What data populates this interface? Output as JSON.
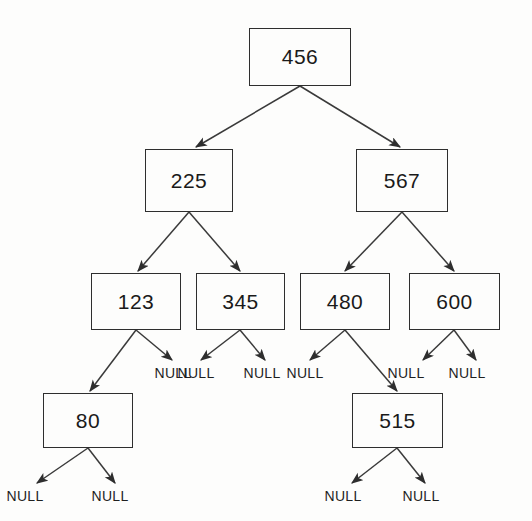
{
  "diagram": {
    "null_label": "NULL",
    "colors": {
      "background": "#fdfdfc",
      "box_border": "#2e2e2e",
      "text": "#1a1a1a",
      "edge": "#3a3a3a"
    },
    "nodes": [
      {
        "id": "n456",
        "value": "456",
        "level": 0,
        "x": 249,
        "y": 28,
        "w": 102,
        "h": 58
      },
      {
        "id": "n225",
        "value": "225",
        "level": 1,
        "x": 145,
        "y": 149,
        "w": 88,
        "h": 63
      },
      {
        "id": "n567",
        "value": "567",
        "level": 1,
        "x": 356,
        "y": 149,
        "w": 92,
        "h": 63
      },
      {
        "id": "n123",
        "value": "123",
        "level": 2,
        "x": 91,
        "y": 273,
        "w": 90,
        "h": 57
      },
      {
        "id": "n345",
        "value": "345",
        "level": 2,
        "x": 196,
        "y": 273,
        "w": 89,
        "h": 57
      },
      {
        "id": "n480",
        "value": "480",
        "level": 2,
        "x": 300,
        "y": 273,
        "w": 90,
        "h": 57
      },
      {
        "id": "n600",
        "value": "600",
        "level": 2,
        "x": 409,
        "y": 273,
        "w": 91,
        "h": 57
      },
      {
        "id": "n80",
        "value": "80",
        "level": 3,
        "x": 43,
        "y": 393,
        "w": 90,
        "h": 55
      },
      {
        "id": "n515",
        "value": "515",
        "level": 3,
        "x": 352,
        "y": 393,
        "w": 91,
        "h": 55
      }
    ],
    "null_children": [
      {
        "id": "null_123_right",
        "parent": "n123",
        "side": "right",
        "x": 173,
        "y": 365
      },
      {
        "id": "null_345_left",
        "parent": "n345",
        "side": "left",
        "x": 196,
        "y": 365
      },
      {
        "id": "null_345_right",
        "parent": "n345",
        "side": "right",
        "x": 262,
        "y": 365
      },
      {
        "id": "null_480_left",
        "parent": "n480",
        "side": "left",
        "x": 305,
        "y": 365
      },
      {
        "id": "null_600_left",
        "parent": "n600",
        "side": "left",
        "x": 406,
        "y": 365
      },
      {
        "id": "null_600_right",
        "parent": "n600",
        "side": "right",
        "x": 467,
        "y": 365
      },
      {
        "id": "null_80_left",
        "parent": "n80",
        "side": "left",
        "x": 25,
        "y": 488
      },
      {
        "id": "null_80_right",
        "parent": "n80",
        "side": "right",
        "x": 110,
        "y": 488
      },
      {
        "id": "null_515_left",
        "parent": "n515",
        "side": "left",
        "x": 343,
        "y": 488
      },
      {
        "id": "null_515_right",
        "parent": "n515",
        "side": "right",
        "x": 421,
        "y": 488
      }
    ],
    "edges": [
      {
        "from": "n456",
        "to": "n225",
        "side": "left",
        "x1": 300,
        "y1": 86,
        "x2": 196,
        "y2": 147
      },
      {
        "from": "n456",
        "to": "n567",
        "side": "right",
        "x1": 300,
        "y1": 86,
        "x2": 400,
        "y2": 147
      },
      {
        "from": "n225",
        "to": "n123",
        "side": "left",
        "x1": 189,
        "y1": 212,
        "x2": 138,
        "y2": 271
      },
      {
        "from": "n225",
        "to": "n345",
        "side": "right",
        "x1": 189,
        "y1": 212,
        "x2": 240,
        "y2": 271
      },
      {
        "from": "n567",
        "to": "n480",
        "side": "left",
        "x1": 402,
        "y1": 212,
        "x2": 345,
        "y2": 271
      },
      {
        "from": "n567",
        "to": "n600",
        "side": "right",
        "x1": 402,
        "y1": 212,
        "x2": 454,
        "y2": 271
      },
      {
        "from": "n123",
        "to": "n80",
        "side": "left",
        "x1": 136,
        "y1": 330,
        "x2": 90,
        "y2": 391
      },
      {
        "from": "n123",
        "to": "null_123_right",
        "side": "right",
        "x1": 136,
        "y1": 330,
        "x2": 172,
        "y2": 360
      },
      {
        "from": "n345",
        "to": "null_345_left",
        "side": "left",
        "x1": 240,
        "y1": 330,
        "x2": 201,
        "y2": 360
      },
      {
        "from": "n345",
        "to": "null_345_right",
        "side": "right",
        "x1": 240,
        "y1": 330,
        "x2": 265,
        "y2": 360
      },
      {
        "from": "n480",
        "to": "null_480_left",
        "side": "left",
        "x1": 345,
        "y1": 330,
        "x2": 310,
        "y2": 360
      },
      {
        "from": "n480",
        "to": "n515",
        "side": "right",
        "x1": 345,
        "y1": 330,
        "x2": 397,
        "y2": 391
      },
      {
        "from": "n600",
        "to": "null_600_left",
        "side": "left",
        "x1": 454,
        "y1": 330,
        "x2": 423,
        "y2": 360
      },
      {
        "from": "n600",
        "to": "null_600_right",
        "side": "right",
        "x1": 454,
        "y1": 330,
        "x2": 476,
        "y2": 360
      },
      {
        "from": "n80",
        "to": "null_80_left",
        "side": "left",
        "x1": 88,
        "y1": 448,
        "x2": 37,
        "y2": 483
      },
      {
        "from": "n80",
        "to": "null_80_right",
        "side": "right",
        "x1": 88,
        "y1": 448,
        "x2": 115,
        "y2": 483
      },
      {
        "from": "n515",
        "to": "null_515_left",
        "side": "left",
        "x1": 397,
        "y1": 448,
        "x2": 352,
        "y2": 483
      },
      {
        "from": "n515",
        "to": "null_515_right",
        "side": "right",
        "x1": 397,
        "y1": 448,
        "x2": 425,
        "y2": 483
      }
    ]
  }
}
